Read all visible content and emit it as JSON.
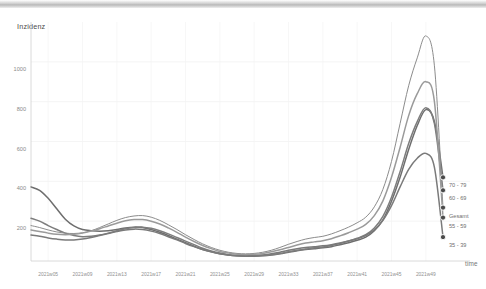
{
  "chart_data": {
    "type": "line",
    "title": "",
    "subtitle": "",
    "xlabel": "time",
    "ylabel": "Inzidenz",
    "ylim": [
      0,
      1200
    ],
    "yticks": [
      200,
      400,
      600,
      800,
      1000
    ],
    "ytick_labels": [
      "200",
      "400",
      "600",
      "800",
      "1000"
    ],
    "grid": true,
    "legend_position": "right-inline-at-line-end",
    "x": [
      "2021w03",
      "2021w04",
      "2021w05",
      "2021w06",
      "2021w07",
      "2021w08",
      "2021w09",
      "2021w10",
      "2021w11",
      "2021w12",
      "2021w13",
      "2021w14",
      "2021w15",
      "2021w16",
      "2021w17",
      "2021w18",
      "2021w19",
      "2021w20",
      "2021w21",
      "2021w22",
      "2021w23",
      "2021w24",
      "2021w25",
      "2021w26",
      "2021w27",
      "2021w28",
      "2021w29",
      "2021w30",
      "2021w31",
      "2021w32",
      "2021w33",
      "2021w34",
      "2021w35",
      "2021w36",
      "2021w37",
      "2021w38",
      "2021w39",
      "2021w40",
      "2021w41",
      "2021w42",
      "2021w43",
      "2021w44",
      "2021w45",
      "2021w46",
      "2021w47",
      "2021w48",
      "2021w49",
      "2021w50",
      "2021w51"
    ],
    "xtick_labels": [
      "2021w05",
      "2021w09",
      "2021w13",
      "2021w17",
      "2021w21",
      "2021w25",
      "2021w29",
      "2021w33",
      "2021w37",
      "2021w41",
      "2021w45",
      "2021w49"
    ],
    "xtick_values": [
      "2021w05",
      "2021w09",
      "2021w13",
      "2021w17",
      "2021w21",
      "2021w25",
      "2021w29",
      "2021w33",
      "2021w37",
      "2021w41",
      "2021w45",
      "2021w49"
    ],
    "series": [
      {
        "name": "70 - 79",
        "color": "#6e6e6e",
        "end_value": 420,
        "values": [
          372,
          355,
          315,
          262,
          210,
          176,
          158,
          152,
          150,
          152,
          158,
          166,
          170,
          168,
          158,
          144,
          128,
          110,
          92,
          74,
          58,
          46,
          36,
          30,
          26,
          24,
          24,
          26,
          30,
          36,
          44,
          52,
          58,
          62,
          66,
          72,
          82,
          92,
          104,
          120,
          152,
          206,
          300,
          420,
          560,
          680,
          760,
          700,
          420
        ]
      },
      {
        "name": "60 - 69",
        "color": "#7d7d7d",
        "end_value": 355,
        "values": [
          215,
          200,
          178,
          158,
          140,
          128,
          122,
          124,
          130,
          140,
          152,
          162,
          168,
          170,
          164,
          152,
          136,
          118,
          100,
          82,
          64,
          50,
          40,
          32,
          28,
          26,
          26,
          28,
          32,
          38,
          46,
          54,
          60,
          66,
          70,
          78,
          88,
          100,
          114,
          132,
          166,
          224,
          320,
          448,
          590,
          700,
          770,
          690,
          355
        ]
      },
      {
        "name": "Gesamt",
        "color": "#8c8c8c",
        "end_value": 268,
        "values": [
          178,
          168,
          156,
          146,
          140,
          138,
          142,
          152,
          168,
          186,
          204,
          218,
          226,
          228,
          220,
          204,
          182,
          158,
          132,
          108,
          86,
          68,
          54,
          44,
          38,
          36,
          38,
          44,
          54,
          68,
          84,
          98,
          110,
          118,
          124,
          136,
          152,
          170,
          192,
          220,
          272,
          360,
          500,
          690,
          880,
          1020,
          1130,
          980,
          268
        ]
      },
      {
        "name": "55 - 59",
        "color": "#9a9a9a",
        "end_value": 218,
        "values": [
          156,
          148,
          140,
          134,
          132,
          134,
          140,
          150,
          162,
          176,
          190,
          202,
          208,
          208,
          200,
          186,
          166,
          144,
          120,
          98,
          78,
          62,
          48,
          40,
          34,
          32,
          34,
          38,
          46,
          56,
          68,
          80,
          90,
          96,
          102,
          112,
          126,
          142,
          160,
          184,
          228,
          302,
          420,
          570,
          730,
          840,
          900,
          800,
          218
        ]
      },
      {
        "name": "35 - 39",
        "color": "#7a7a7a",
        "end_value": 120,
        "values": [
          130,
          124,
          116,
          110,
          106,
          106,
          110,
          118,
          128,
          138,
          148,
          156,
          160,
          158,
          150,
          138,
          122,
          106,
          88,
          72,
          58,
          46,
          36,
          30,
          26,
          24,
          26,
          30,
          36,
          44,
          54,
          62,
          68,
          72,
          76,
          82,
          90,
          100,
          112,
          128,
          156,
          204,
          278,
          372,
          460,
          516,
          540,
          470,
          120
        ]
      }
    ]
  },
  "axis": {
    "y_title": "Inzidenz",
    "x_title": "time"
  }
}
